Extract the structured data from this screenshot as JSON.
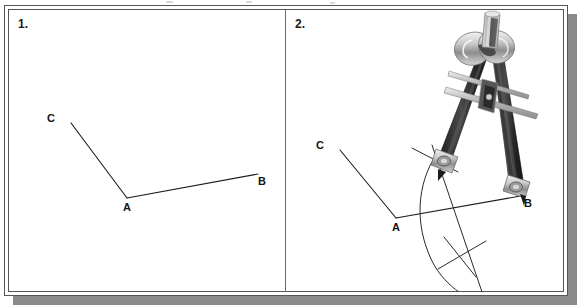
{
  "figure": {
    "background_color": "#ffffff",
    "frame_color": "#555555",
    "shadow_color": "#8a8a8a",
    "ink_color": "#1a1a1a"
  },
  "panels": [
    {
      "number": "1.",
      "caption": "",
      "labels": {
        "a": "A",
        "b": "B",
        "c": "C"
      }
    },
    {
      "number": "2.",
      "caption": "",
      "labels": {
        "a": "A",
        "b": "B",
        "c": "C"
      }
    }
  ],
  "instrument": {
    "name": "compass",
    "body_color": "#2e2e2e",
    "metal_color": "#b8b8b8",
    "highlight_color": "#efefef"
  }
}
